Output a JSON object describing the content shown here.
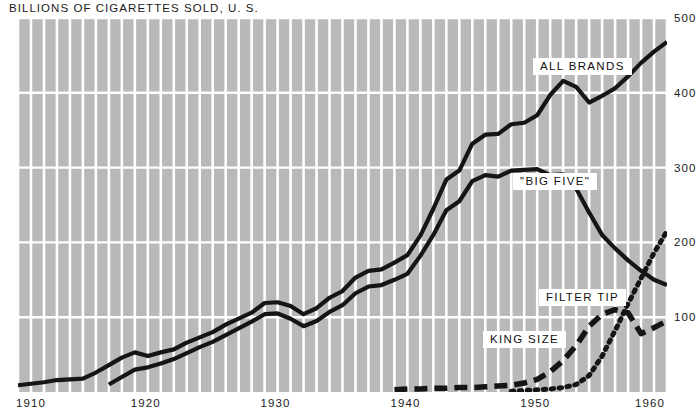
{
  "chart_data": {
    "type": "line",
    "title": "BILLIONS OF CIGARETTES SOLD, U. S.",
    "xlabel": "",
    "ylabel": "",
    "xlim": [
      1910,
      1960
    ],
    "ylim": [
      0,
      500
    ],
    "grid": true,
    "legend_position": "inline-labels",
    "xticks": [
      "1910",
      "1920",
      "1930",
      "1940",
      "1950",
      "1960"
    ],
    "xtick_values": [
      1910,
      1920,
      1930,
      1940,
      1950,
      1960
    ],
    "yticks": [
      "100",
      "200",
      "300",
      "400",
      "500"
    ],
    "ytick_values": [
      100,
      200,
      300,
      400,
      500
    ],
    "series": [
      {
        "name": "ALL BRANDS",
        "style": "solid",
        "label": "ALL BRANDS",
        "x": [
          1910,
          1911,
          1912,
          1913,
          1914,
          1915,
          1916,
          1917,
          1918,
          1919,
          1920,
          1921,
          1922,
          1923,
          1924,
          1925,
          1926,
          1927,
          1928,
          1929,
          1930,
          1931,
          1932,
          1933,
          1934,
          1935,
          1936,
          1937,
          1938,
          1939,
          1940,
          1941,
          1942,
          1943,
          1944,
          1945,
          1946,
          1947,
          1948,
          1949,
          1950,
          1951,
          1952,
          1953,
          1954,
          1955,
          1956,
          1957,
          1958,
          1959,
          1960
        ],
        "values": [
          9,
          11,
          13,
          16,
          17,
          18,
          26,
          36,
          46,
          53,
          48,
          53,
          57,
          66,
          73,
          80,
          90,
          98,
          106,
          119,
          120,
          115,
          104,
          112,
          126,
          135,
          153,
          162,
          164,
          173,
          183,
          209,
          245,
          284,
          296,
          332,
          344,
          345,
          358,
          360,
          370,
          397,
          416,
          408,
          387,
          396,
          406,
          422,
          440,
          455,
          468
        ]
      },
      {
        "name": "BIG FIVE",
        "style": "solid",
        "label": "\"BIG FIVE\"",
        "x": [
          1917,
          1918,
          1919,
          1920,
          1921,
          1922,
          1923,
          1924,
          1925,
          1926,
          1927,
          1928,
          1929,
          1930,
          1931,
          1932,
          1933,
          1934,
          1935,
          1936,
          1937,
          1938,
          1939,
          1940,
          1941,
          1942,
          1943,
          1944,
          1945,
          1946,
          1947,
          1948,
          1949,
          1950,
          1951,
          1952,
          1953,
          1954,
          1955,
          1956,
          1957,
          1958,
          1959,
          1960
        ],
        "values": [
          10,
          20,
          30,
          33,
          38,
          44,
          52,
          60,
          67,
          76,
          85,
          94,
          104,
          105,
          98,
          88,
          95,
          107,
          116,
          132,
          141,
          143,
          150,
          158,
          182,
          210,
          243,
          255,
          282,
          290,
          288,
          296,
          297,
          298,
          290,
          291,
          272,
          240,
          210,
          192,
          176,
          162,
          150,
          143
        ]
      },
      {
        "name": "KING SIZE",
        "style": "dashed",
        "label": "KING SIZE",
        "x": [
          1939,
          1940,
          1941,
          1942,
          1943,
          1944,
          1945,
          1946,
          1947,
          1948,
          1949,
          1950,
          1951,
          1952,
          1953,
          1954,
          1955,
          1956,
          1957,
          1958,
          1959,
          1960
        ],
        "values": [
          3,
          4,
          4,
          5,
          5,
          6,
          6,
          7,
          8,
          9,
          12,
          17,
          27,
          42,
          62,
          88,
          104,
          110,
          106,
          78,
          86,
          95
        ]
      },
      {
        "name": "FILTER TIP",
        "style": "dotted",
        "label": "FILTER TIP",
        "x": [
          1948,
          1949,
          1950,
          1951,
          1952,
          1953,
          1954,
          1955,
          1956,
          1957,
          1958,
          1959,
          1960
        ],
        "values": [
          1,
          2,
          3,
          4,
          6,
          10,
          22,
          48,
          82,
          118,
          152,
          186,
          215
        ]
      }
    ],
    "colors": {
      "plot_background": "#b9b9b9",
      "gridline": "#ffffff",
      "series_line": "#151515",
      "text": "#1a1a1a",
      "page_background": "#ffffff",
      "label_background": "#ffffff"
    }
  }
}
